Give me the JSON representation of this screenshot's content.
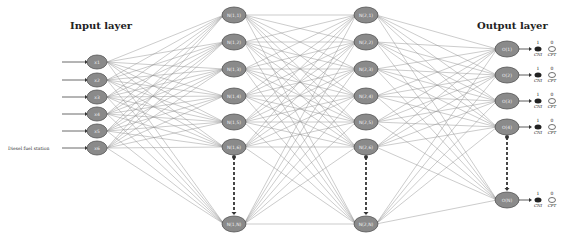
{
  "titles": {
    "input": "Input layer",
    "output": "Output layer"
  },
  "input_side_label": "Diesel fuel station",
  "layers": {
    "input": {
      "x": 97,
      "nodes": [
        {
          "label": "x1",
          "y": 62
        },
        {
          "label": "x2",
          "y": 80
        },
        {
          "label": "x3",
          "y": 97
        },
        {
          "label": "x4",
          "y": 114
        },
        {
          "label": "x5",
          "y": 131
        },
        {
          "label": "x6",
          "y": 148
        }
      ]
    },
    "hidden1": {
      "x": 234,
      "nodes": [
        {
          "label": "N(1,1)",
          "y": 15
        },
        {
          "label": "N(1,2)",
          "y": 42
        },
        {
          "label": "N(1,3)",
          "y": 69
        },
        {
          "label": "N(1,4)",
          "y": 96
        },
        {
          "label": "N(1,5)",
          "y": 122
        },
        {
          "label": "N(1,6)",
          "y": 147
        },
        {
          "label": "N(1,N)",
          "y": 224
        }
      ]
    },
    "hidden2": {
      "x": 366,
      "nodes": [
        {
          "label": "N(2,1)",
          "y": 15
        },
        {
          "label": "N(2,2)",
          "y": 42
        },
        {
          "label": "N(2,3)",
          "y": 69
        },
        {
          "label": "N(2,4)",
          "y": 96
        },
        {
          "label": "N(2,5)",
          "y": 122
        },
        {
          "label": "N(2,6)",
          "y": 147
        },
        {
          "label": "N(2,N)",
          "y": 224
        }
      ]
    },
    "output": {
      "x": 507,
      "nodes": [
        {
          "label": "O(1)",
          "y": 49
        },
        {
          "label": "O(2)",
          "y": 75
        },
        {
          "label": "O(3)",
          "y": 101
        },
        {
          "label": "O(4)",
          "y": 127
        },
        {
          "label": "O(N)",
          "y": 200
        }
      ]
    }
  },
  "output_icons": {
    "one_label": "1",
    "zero_label": "0",
    "filled_caption": "CNI",
    "empty_caption": "CPT"
  },
  "colors": {
    "node_fill": "#8a8a8a",
    "node_stroke": "#555555",
    "edge": "#8c8c8c",
    "text": "#222222"
  }
}
